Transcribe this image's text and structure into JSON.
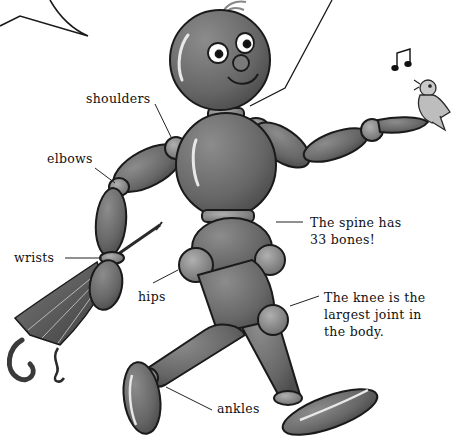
{
  "illustration": {
    "subject": "jointed mannequin figure walking with umbrella and singing bird",
    "colors": {
      "body": "#6f6f6f",
      "body_dark": "#4a4a4a",
      "outline": "#1a1a1a",
      "highlight": "#e8e8e8",
      "joint": "#8a8a8a",
      "bird": "#bdbdbd",
      "background": "#ffffff"
    }
  },
  "labels": {
    "shoulders": "shoulders",
    "elbows": "elbows",
    "wrists": "wrists",
    "hips": "hips",
    "ankles": "ankles",
    "spine": [
      "The spine has",
      "33 bones!"
    ],
    "knee": [
      "The knee is the",
      "largest joint in",
      "the body."
    ]
  },
  "decorations": {
    "music_note": "♫"
  }
}
